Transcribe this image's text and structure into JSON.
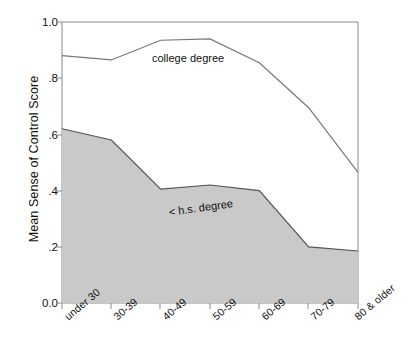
{
  "chart_data": {
    "type": "area",
    "title": "",
    "xlabel": "",
    "ylabel": "Mean Sense of Control Score",
    "categories": [
      "under 30",
      "30-39",
      "40-49",
      "50-59",
      "60-69",
      "70-79",
      "80 & older"
    ],
    "ylim": [
      0.0,
      1.0
    ],
    "yticks": [
      "0.0",
      ".2",
      ".4",
      ".6",
      ".8",
      "1.0"
    ],
    "ytick_values": [
      0.0,
      0.2,
      0.4,
      0.6,
      0.8,
      1.0
    ],
    "grid": false,
    "legend_position": "inline-annotation",
    "series": [
      {
        "name": "college degree",
        "render": "line",
        "color": "#555555",
        "values": [
          0.88,
          0.865,
          0.935,
          0.94,
          0.855,
          0.695,
          0.465
        ]
      },
      {
        "name": "< h.s. degree",
        "render": "filled-area",
        "color": "#555555",
        "fill": "#c9c9c9",
        "values": [
          0.62,
          0.58,
          0.405,
          0.42,
          0.4,
          0.2,
          0.185
        ]
      }
    ],
    "annotations": [
      {
        "text": "college degree",
        "series": "college degree"
      },
      {
        "text": "< h.s. degree",
        "series": "< h.s. degree"
      }
    ]
  },
  "axis": {
    "y_title": "Mean Sense of Control Score",
    "y_labels": [
      "1.0",
      ".8",
      ".6",
      ".4",
      ".2",
      "0.0"
    ],
    "x_labels": [
      "under 30",
      "30-39",
      "40-49",
      "50-59",
      "60-69",
      "70-79",
      "80 & older"
    ]
  },
  "labels": {
    "college": "college degree",
    "hs": "< h.s. degree"
  },
  "colors": {
    "area_fill": "#c9c9c9",
    "line": "#555555",
    "axis": "#888888",
    "text": "#111111",
    "background": "#ffffff"
  }
}
